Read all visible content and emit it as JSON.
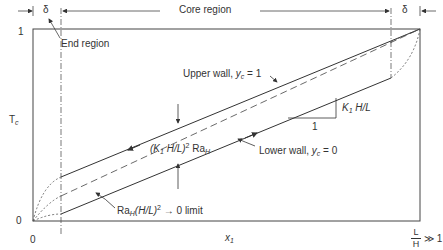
{
  "diagram": {
    "type": "temperature-profile-schematic",
    "regions": {
      "end_region_symbol": "δ",
      "end_region_symbol_right": "δ",
      "end_region_label": "End region",
      "core_region_label": "Core region"
    },
    "axes": {
      "y_label_main": "T",
      "y_label_sub": "c",
      "y_top_tick": "1",
      "y_bottom_tick": "0",
      "x_origin_tick": "0",
      "x_label_main": "x",
      "x_label_sub": "1",
      "x_end_num": "L",
      "x_end_den": "H",
      "x_end_suffix": "≫ 1"
    },
    "annotations": {
      "upper_wall_text": "Upper wall, ",
      "upper_wall_var": "y",
      "upper_wall_sub": "c",
      "upper_wall_eq": " = 1",
      "lower_wall_text": "Lower wall, ",
      "lower_wall_var": "y",
      "lower_wall_sub": "c",
      "lower_wall_eq": " = 0",
      "slope_label_k": "K",
      "slope_label_k_sub": "1",
      "slope_label_rest": " H/L",
      "slope_run": "1",
      "gap_label_open": "(K",
      "gap_label_k_sub": "1",
      "gap_label_mid": " H/L)",
      "gap_label_sup": "2",
      "gap_label_ra": " Ra",
      "gap_label_ra_sub": "H",
      "limit_label_ra": "Ra",
      "limit_label_ra_sub": "H",
      "limit_label_mid": "(H/L)",
      "limit_label_sup": "2",
      "limit_label_arrow": " → 0  limit"
    },
    "colors": {
      "line": "#333333",
      "background": "#ffffff"
    }
  }
}
